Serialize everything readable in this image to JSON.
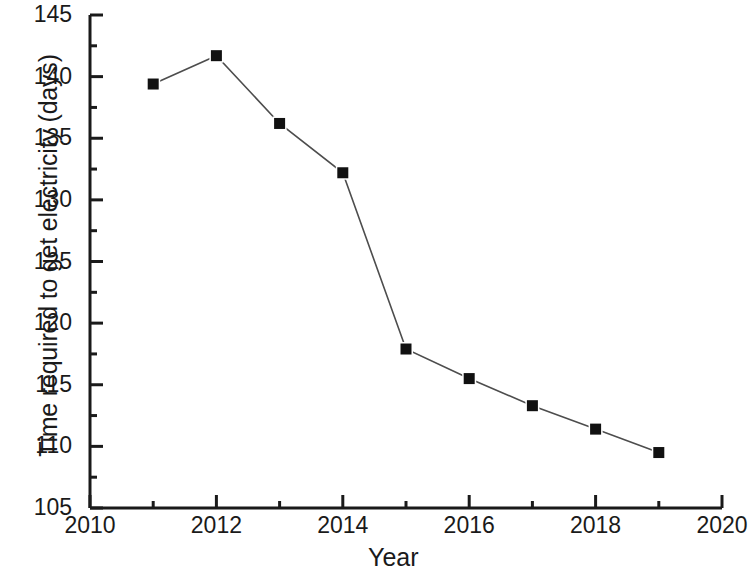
{
  "chart_data": {
    "type": "line",
    "title": "",
    "subtitle": "",
    "xlabel": "Year",
    "ylabel": "Time required to get electricity (days)",
    "x": [
      2011,
      2012,
      2013,
      2014,
      2015,
      2016,
      2017,
      2018,
      2019
    ],
    "values": [
      139.4,
      141.7,
      136.2,
      132.2,
      117.9,
      115.5,
      113.3,
      111.4,
      109.5
    ],
    "series": [
      {
        "name": "Time required to get electricity (days)",
        "values": [
          139.4,
          141.7,
          136.2,
          132.2,
          117.9,
          115.5,
          113.3,
          111.4,
          109.5
        ]
      }
    ],
    "xlim": [
      2010,
      2020
    ],
    "ylim": [
      105,
      145
    ],
    "xticks": [
      2010,
      2012,
      2014,
      2016,
      2018,
      2020
    ],
    "xtick_labels": [
      "2010",
      "2012",
      "2014",
      "2016",
      "2018",
      "2020"
    ],
    "x_minor_tick_interval": 1,
    "yticks": [
      105,
      110,
      115,
      120,
      125,
      130,
      135,
      140,
      145
    ],
    "ytick_labels": [
      "105",
      "110",
      "115",
      "120",
      "125",
      "130",
      "135",
      "140",
      "145"
    ],
    "y_minor_tick_interval": 2.5,
    "grid": false,
    "legend": "none",
    "marker": "filled-square",
    "marker_color": "#111111",
    "line_color": "#4d4d4d",
    "axis_color": "#1a1a1a",
    "background_color": "#ffffff",
    "spines": [
      "left",
      "bottom"
    ]
  }
}
